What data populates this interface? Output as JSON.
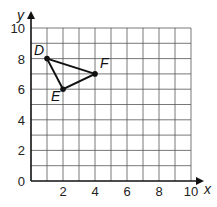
{
  "chart_data": {
    "type": "scatter",
    "title": "",
    "xlabel": "x",
    "ylabel": "y",
    "xlim": [
      0,
      10
    ],
    "ylim": [
      0,
      10
    ],
    "grid": true,
    "grid_step": 1,
    "x_ticks": [
      0,
      2,
      4,
      6,
      8,
      10
    ],
    "y_ticks": [
      0,
      2,
      4,
      6,
      8,
      10
    ],
    "x_tick_labels": [
      "2",
      "4",
      "6",
      "8",
      "10"
    ],
    "y_tick_labels": [
      "0",
      "2",
      "4",
      "6",
      "8",
      "10"
    ],
    "points": [
      {
        "label": "D",
        "x": 1,
        "y": 8
      },
      {
        "label": "E",
        "x": 2,
        "y": 6
      },
      {
        "label": "F",
        "x": 4,
        "y": 7
      }
    ],
    "polygon": [
      "D",
      "E",
      "F"
    ]
  }
}
